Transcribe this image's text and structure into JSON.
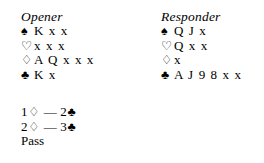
{
  "document": {
    "type": "bridge-bidding-example",
    "background_color": "#ffffff",
    "text_color": "#000000"
  },
  "suits": {
    "spade": "♠",
    "heart": "♡",
    "diamond": "♢",
    "club": "♣"
  },
  "hands": [
    {
      "title": "Opener",
      "rows": [
        {
          "suit_symbol": "♠",
          "suit_name": "spade-symbol",
          "cards": "K x x"
        },
        {
          "suit_symbol": "♡",
          "suit_name": "heart-symbol",
          "cards": "x x x"
        },
        {
          "suit_symbol": "♢",
          "suit_name": "diamond-symbol",
          "cards": "A Q x x x"
        },
        {
          "suit_symbol": "♣",
          "suit_name": "club-symbol",
          "cards": "K x"
        }
      ]
    },
    {
      "title": "Responder",
      "rows": [
        {
          "suit_symbol": "♠",
          "suit_name": "spade-symbol",
          "cards": "Q J x"
        },
        {
          "suit_symbol": "♡",
          "suit_name": "heart-symbol",
          "cards": "Q x x"
        },
        {
          "suit_symbol": "♢",
          "suit_name": "diamond-symbol",
          "cards": "x"
        },
        {
          "suit_symbol": "♣",
          "suit_name": "club-symbol",
          "cards": "A J 9 8 x x"
        }
      ]
    }
  ],
  "auction": {
    "rounds": [
      {
        "opener_level": "1",
        "opener_suit": "♢",
        "dash": "—",
        "responder_level": "2",
        "responder_suit": "♣"
      },
      {
        "opener_level": "2",
        "opener_suit": "♢",
        "dash": "—",
        "responder_level": "3",
        "responder_suit": "♣"
      }
    ],
    "final_call": "Pass"
  }
}
